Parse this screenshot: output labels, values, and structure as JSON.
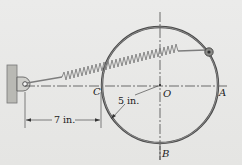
{
  "figure": {
    "points": {
      "C": "C",
      "O": "O",
      "A": "A",
      "B": "B"
    },
    "dimensions": {
      "horizontal": "7 in.",
      "radius": "5 in."
    },
    "elements": [
      "wall-bracket",
      "spring",
      "ring",
      "collar",
      "centerlines"
    ],
    "colors": {
      "ring": "#555555",
      "spring": "#8a8a8a",
      "background": "#e8e8e6",
      "wall": "#b9b9b4"
    }
  }
}
